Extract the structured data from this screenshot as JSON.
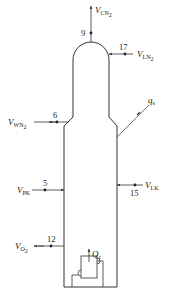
{
  "diagram": {
    "type": "column-schematic",
    "colors": {
      "line": "#333333",
      "background": "#ffffff"
    },
    "streams": [
      {
        "id": "top-product",
        "node": "9",
        "label_main": "V",
        "label_sub": "CN",
        "label_sub2": "2",
        "direction": "out-up"
      },
      {
        "id": "liquid-nitrogen",
        "node": "17",
        "label_main": "V",
        "label_sub": "LN",
        "label_sub2": "2",
        "direction": "in-left"
      },
      {
        "id": "waste-nitrogen",
        "node": "6",
        "label_main": "V",
        "label_sub": "WN",
        "label_sub2": "2",
        "direction": "out-left"
      },
      {
        "id": "expanded-air",
        "node": "5",
        "label_main": "V",
        "label_sub": "PK",
        "label_sub2": "",
        "direction": "in-right"
      },
      {
        "id": "liquid-air",
        "node": "15",
        "label_main": "V",
        "label_sub": "LK",
        "label_sub2": "",
        "direction": "in-left"
      },
      {
        "id": "oxygen-product",
        "node": "12",
        "label_main": "V",
        "label_sub": "O",
        "label_sub2": "2",
        "direction": "out-left"
      }
    ],
    "heat_leak": {
      "label_main": "q",
      "label_sub": "s"
    },
    "reboiler": {
      "label_main": "Q",
      "label_sub": "c"
    }
  }
}
